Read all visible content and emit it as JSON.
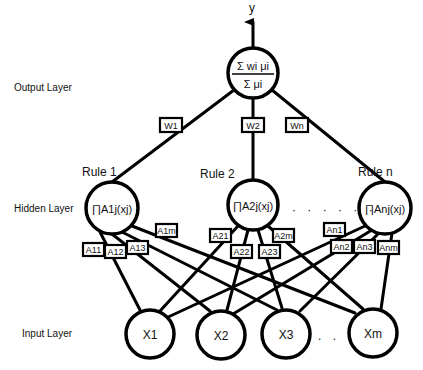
{
  "diagram": {
    "type": "fuzzy-neural-network",
    "layers": {
      "output": "Output Layer",
      "hidden": "Hidden Layer",
      "input": "Input Layer"
    },
    "output_node": {
      "label_out": "y",
      "numerator": "Σ wi μi",
      "denominator": "Σ μi"
    },
    "weights": [
      "W1",
      "W2",
      "Wn"
    ],
    "rules": [
      {
        "title": "Rule 1",
        "node": "∏A1j(xj)",
        "memberships": [
          "A11",
          "A12",
          "A13",
          "A1m"
        ]
      },
      {
        "title": "Rule 2",
        "node": "∏A2j(xj)",
        "memberships": [
          "A21",
          "A22",
          "A23",
          "A2m"
        ]
      },
      {
        "title": "Rule n",
        "node": "∏Anj(xj)",
        "memberships": [
          "An1",
          "An2",
          "An3",
          "Anm"
        ]
      }
    ],
    "inputs": [
      "X1",
      "X2",
      "X3",
      "Xm"
    ],
    "ellipsis_hidden": "· · · · · ·",
    "ellipsis_input": ". . ."
  }
}
